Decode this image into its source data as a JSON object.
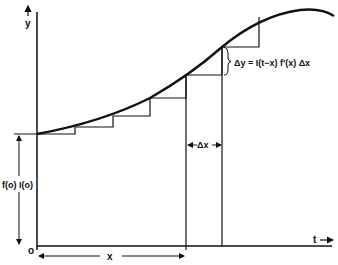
{
  "diagram": {
    "labels": {
      "y_axis": "y",
      "t_axis": "t",
      "origin": "o",
      "x_dim": "x",
      "delta_x": "Δx",
      "delta_y_formula": "Δy = I(t−x) f′(x) Δx",
      "initial_value": "f(o) I(o)"
    },
    "colors": {
      "ink": "#111111",
      "background": "#ffffff"
    }
  }
}
